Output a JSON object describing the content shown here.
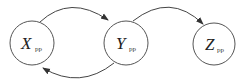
{
  "diagram": {
    "nodes": [
      {
        "id": "X",
        "label": "X",
        "subscript": "pp"
      },
      {
        "id": "Y",
        "label": "Y",
        "subscript": "pp"
      },
      {
        "id": "Z",
        "label": "Z",
        "subscript": "pp"
      }
    ],
    "edges": [
      {
        "from": "X",
        "to": "Y"
      },
      {
        "from": "Y",
        "to": "X"
      },
      {
        "from": "Y",
        "to": "Z"
      }
    ],
    "colors": {
      "stroke": "#444444",
      "text": "#222222",
      "background": "#ffffff"
    }
  }
}
